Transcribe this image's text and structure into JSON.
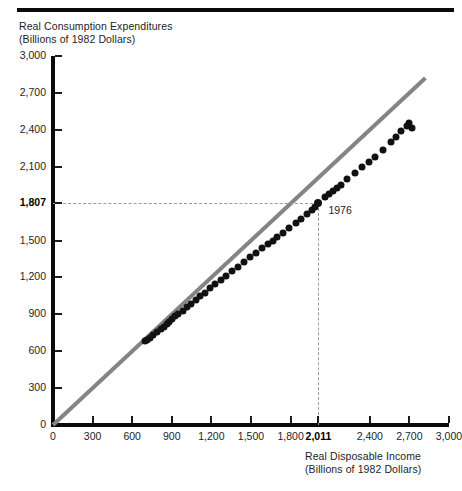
{
  "figure": {
    "top_rule": "decorative-rule"
  },
  "chart_data": {
    "type": "scatter",
    "title": "",
    "ylabel_line1": "Real Consumption Expenditures",
    "ylabel_line2": "(Billions of 1982 Dollars)",
    "xlabel_line1": "Real Disposable Income",
    "xlabel_line2": "(Billions of 1982 Dollars)",
    "xlim": [
      0,
      3000
    ],
    "ylim": [
      0,
      3000
    ],
    "grid": false,
    "legend": "none",
    "xticks": [
      {
        "value": 0,
        "label": "0",
        "bold": false
      },
      {
        "value": 300,
        "label": "300",
        "bold": false
      },
      {
        "value": 600,
        "label": "600",
        "bold": false
      },
      {
        "value": 900,
        "label": "900",
        "bold": false
      },
      {
        "value": 1200,
        "label": "1,200",
        "bold": false
      },
      {
        "value": 1500,
        "label": "1,500",
        "bold": false
      },
      {
        "value": 1800,
        "label": "1,800",
        "bold": false
      },
      {
        "value": 2011,
        "label": "2,011",
        "bold": true
      },
      {
        "value": 2400,
        "label": "2,400",
        "bold": false
      },
      {
        "value": 2700,
        "label": "2,700",
        "bold": false
      },
      {
        "value": 3000,
        "label": "3,000",
        "bold": false
      }
    ],
    "yticks": [
      {
        "value": 0,
        "label": "0",
        "bold": false
      },
      {
        "value": 300,
        "label": "300",
        "bold": false
      },
      {
        "value": 600,
        "label": "600",
        "bold": false
      },
      {
        "value": 900,
        "label": "900",
        "bold": false
      },
      {
        "value": 1200,
        "label": "1,200",
        "bold": false
      },
      {
        "value": 1500,
        "label": "1,500",
        "bold": false
      },
      {
        "value": 1807,
        "label": "1,807",
        "bold": true
      },
      {
        "value": 2100,
        "label": "2,100",
        "bold": false
      },
      {
        "value": 2400,
        "label": "2,400",
        "bold": false
      },
      {
        "value": 2700,
        "label": "2,700",
        "bold": false
      },
      {
        "value": 3000,
        "label": "3,000",
        "bold": false
      }
    ],
    "reference_line": {
      "name": "45-degree-line",
      "from": [
        0,
        0
      ],
      "to": [
        2820,
        2820
      ],
      "color": "#848484"
    },
    "highlight": {
      "label": "1976",
      "x": 2011,
      "y": 1807,
      "guide_lines": "dashed"
    },
    "points": [
      [
        700,
        680
      ],
      [
        712,
        690
      ],
      [
        735,
        710
      ],
      [
        758,
        730
      ],
      [
        790,
        758
      ],
      [
        815,
        782
      ],
      [
        838,
        800
      ],
      [
        860,
        822
      ],
      [
        880,
        840
      ],
      [
        905,
        862
      ],
      [
        928,
        884
      ],
      [
        950,
        905
      ],
      [
        985,
        930
      ],
      [
        1012,
        958
      ],
      [
        1045,
        985
      ],
      [
        1080,
        1015
      ],
      [
        1115,
        1045
      ],
      [
        1150,
        1075
      ],
      [
        1190,
        1110
      ],
      [
        1230,
        1145
      ],
      [
        1270,
        1178
      ],
      [
        1310,
        1210
      ],
      [
        1355,
        1248
      ],
      [
        1400,
        1288
      ],
      [
        1445,
        1325
      ],
      [
        1490,
        1362
      ],
      [
        1535,
        1400
      ],
      [
        1580,
        1435
      ],
      [
        1625,
        1470
      ],
      [
        1670,
        1500
      ],
      [
        1700,
        1525
      ],
      [
        1740,
        1560
      ],
      [
        1790,
        1598
      ],
      [
        1840,
        1640
      ],
      [
        1880,
        1672
      ],
      [
        1925,
        1712
      ],
      [
        1960,
        1745
      ],
      [
        1985,
        1772
      ],
      [
        2011,
        1807
      ],
      [
        2060,
        1850
      ],
      [
        2090,
        1878
      ],
      [
        2120,
        1900
      ],
      [
        2150,
        1928
      ],
      [
        2180,
        1950
      ],
      [
        2230,
        1998
      ],
      [
        2290,
        2048
      ],
      [
        2340,
        2095
      ],
      [
        2395,
        2142
      ],
      [
        2440,
        2180
      ],
      [
        2500,
        2235
      ],
      [
        2560,
        2300
      ],
      [
        2600,
        2345
      ],
      [
        2640,
        2388
      ],
      [
        2680,
        2430
      ],
      [
        2700,
        2455
      ],
      [
        2720,
        2412
      ]
    ]
  }
}
